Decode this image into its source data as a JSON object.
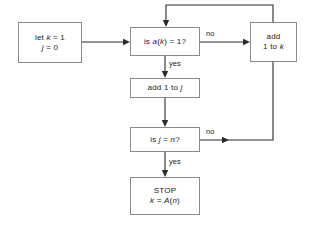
{
  "diagram": {
    "background_color": "#ffffff",
    "box_border_color": "#8a8a8a",
    "line_color": "#2b2b2b"
  },
  "nodes": {
    "init": {
      "name": "init-box",
      "line1_a": "let ",
      "line1_k": "k",
      "line1_b": " = 1",
      "line2_j": "j",
      "line2_b": " = 0"
    },
    "decision_a": {
      "name": "decision-a-k-equals-1",
      "pre": "is ",
      "var_a": "a",
      "paren_open": "(",
      "var_k": "k",
      "paren_close": ")",
      "post": " = 1?"
    },
    "add_k": {
      "name": "add-1-to-k-box",
      "line1": "add",
      "line2_pre": "1 to ",
      "line2_k": "k"
    },
    "add_j": {
      "name": "add-1-to-j-box",
      "pre": "add 1 to ",
      "var_j": "j"
    },
    "decision_j": {
      "name": "decision-j-equals-n",
      "pre": "is ",
      "var_j": "j",
      "mid": " = ",
      "var_n": "n",
      "post": "?"
    },
    "stop": {
      "name": "stop-box",
      "line1": "STOP",
      "line2_k": "k",
      "line2_mid": " = ",
      "line2_A": "A",
      "line2_paren_open": "(",
      "line2_n": "n",
      "line2_paren_close": ")"
    }
  },
  "edge_labels": {
    "no_top": "no",
    "yes_top": "yes",
    "no_bottom": "no",
    "yes_bottom": "yes"
  }
}
